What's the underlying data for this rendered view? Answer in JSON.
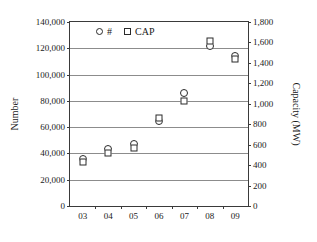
{
  "chart_data": {
    "type": "scatter",
    "title": "",
    "xlabel": "",
    "ylabel": "Number",
    "ylabel_secondary": "Capacity (MW)",
    "categories": [
      "03",
      "04",
      "05",
      "06",
      "07",
      "08",
      "09"
    ],
    "grid": true,
    "legend_position": "top-left-inside",
    "yaxis_left": {
      "label": "Number",
      "min": 0,
      "max": 140000,
      "step": 20000,
      "ticks": [
        "0",
        "20,000",
        "40,000",
        "60,000",
        "80,000",
        "100,000",
        "120,000",
        "140,000"
      ],
      "tick_values": [
        0,
        20000,
        40000,
        60000,
        80000,
        100000,
        120000,
        140000
      ]
    },
    "yaxis_right": {
      "label": "Capacity (MW)",
      "min": 0,
      "max": 1800,
      "step": 200,
      "ticks": [
        "0",
        "200",
        "400",
        "600",
        "800",
        "1,000",
        "1,200",
        "1,400",
        "1,600",
        "1,800"
      ],
      "tick_values": [
        0,
        200,
        400,
        600,
        800,
        1000,
        1200,
        1400,
        1600,
        1800
      ]
    },
    "series": [
      {
        "name": "#",
        "legend_label": "#",
        "marker": "circle",
        "axis": "left",
        "color": "#2a2a2a",
        "values": [
          36000,
          43000,
          47000,
          65000,
          86000,
          122000,
          114000
        ]
      },
      {
        "name": "CAP",
        "legend_label": "CAP",
        "marker": "square",
        "axis": "right",
        "color": "#2a2a2a",
        "values": [
          435,
          515,
          565,
          860,
          1025,
          1615,
          1440
        ]
      }
    ]
  },
  "legend": {
    "entries": [
      {
        "label": "#",
        "marker": "circle"
      },
      {
        "label": "CAP",
        "marker": "square"
      }
    ]
  }
}
